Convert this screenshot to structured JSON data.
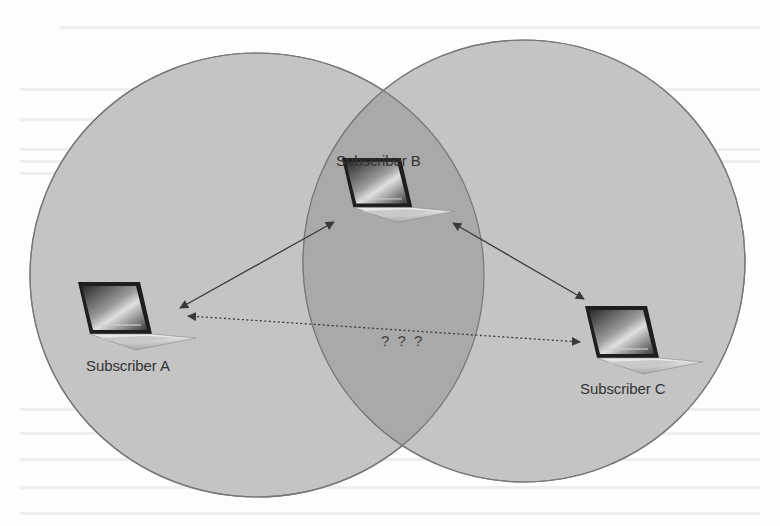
{
  "diagram": {
    "colors": {
      "circle_fill": "#c4c4c4",
      "overlap_fill": "#a9a9a9",
      "circle_stroke": "#777777",
      "arrow": "#3a3a3a",
      "label_text": "#333333",
      "background": "#fdfdfc"
    },
    "regions": [
      {
        "name": "left-coverage-circle",
        "cx": 257,
        "cy": 275,
        "rx": 227,
        "ry": 222
      },
      {
        "name": "right-coverage-circle",
        "cx": 524,
        "cy": 261,
        "rx": 221,
        "ry": 221
      }
    ],
    "nodes": [
      {
        "id": "A",
        "label": "Subscriber A",
        "icon": "laptop-icon"
      },
      {
        "id": "B",
        "label": "Subscriber B",
        "icon": "laptop-icon"
      },
      {
        "id": "C",
        "label": "Subscriber C",
        "icon": "laptop-icon"
      }
    ],
    "links": [
      {
        "from": "A",
        "to": "B",
        "style": "solid",
        "bidirectional": true
      },
      {
        "from": "B",
        "to": "C",
        "style": "solid",
        "bidirectional": true
      },
      {
        "from": "A",
        "to": "C",
        "style": "dotted",
        "bidirectional": true,
        "label": "? ? ?"
      }
    ]
  }
}
